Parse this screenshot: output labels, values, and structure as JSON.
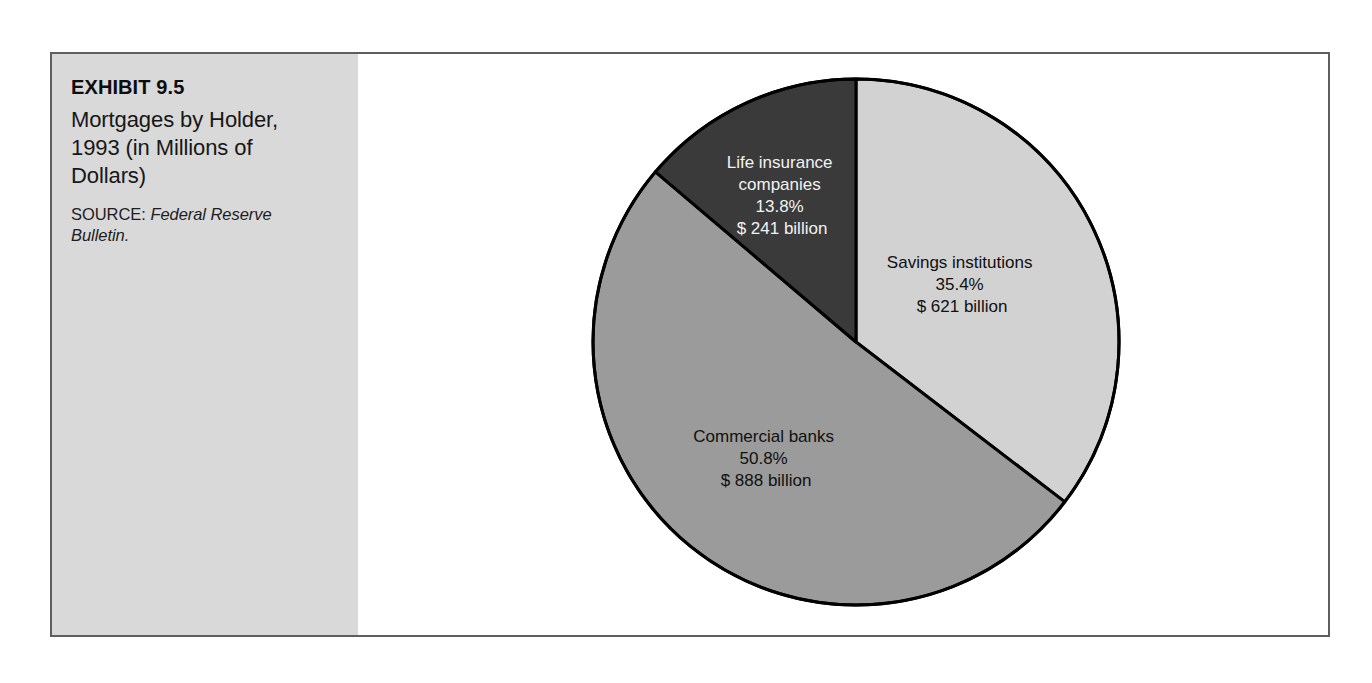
{
  "figure": {
    "exhibit_number": "EXHIBIT 9.5",
    "title": "Mortgages by Holder, 1993 (in Millions of Dollars)",
    "source_label": "SOURCE:",
    "source_reference": "Federal Reserve Bulletin."
  },
  "chart_data": {
    "type": "pie",
    "title": "Mortgages by Holder, 1993 (in Millions of Dollars)",
    "xlabel": "",
    "ylabel": "",
    "units": "billions of dollars",
    "start_angle_deg": 0,
    "direction": "clockwise",
    "categories": [
      "Savings institutions",
      "Commercial banks",
      "Life insurance companies"
    ],
    "values": [
      621,
      888,
      241
    ],
    "percentages": [
      35.4,
      50.8,
      13.8
    ],
    "legend_position": "none",
    "labels_inside_slices": true,
    "slices": [
      {
        "name": "Savings institutions",
        "percent_text": "35.4%",
        "value_text": "$ 621 billion",
        "percent": 35.4,
        "value": 621,
        "color": "#d2d2d2",
        "label_on_dark": false
      },
      {
        "name": "Commercial banks",
        "percent_text": "50.8%",
        "value_text": "$ 888 billion",
        "percent": 50.8,
        "value": 888,
        "color": "#9b9b9b",
        "label_on_dark": false
      },
      {
        "name": "Life insurance companies",
        "percent_text": "13.8%",
        "value_text": "$ 241 billion",
        "percent": 13.8,
        "value": 241,
        "color": "#3a3a3a",
        "label_on_dark": true
      }
    ],
    "label_lines": {
      "savings": [
        "Savings institutions",
        "35.4%",
        "$ 621 billion"
      ],
      "commercial": [
        "Commercial banks",
        "50.8%",
        "$ 888 billion"
      ],
      "life": [
        "Life insurance",
        "companies",
        "13.8%",
        "$ 241 billion"
      ]
    },
    "colors": {
      "outline": "#000000",
      "background": "#ffffff",
      "caption_panel": "#d9d9d9",
      "frame_border": "#5e5e5e"
    }
  }
}
